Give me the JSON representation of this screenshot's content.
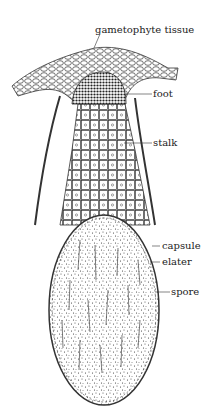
{
  "labels": {
    "gametophyte_tissue": "gametophyte tissue",
    "foot": "foot",
    "stalk": "stalk",
    "capsule": "capsule",
    "elater": "elater",
    "spore": "spore"
  },
  "colors": {
    "ink": "#222222",
    "background": "#ffffff"
  }
}
